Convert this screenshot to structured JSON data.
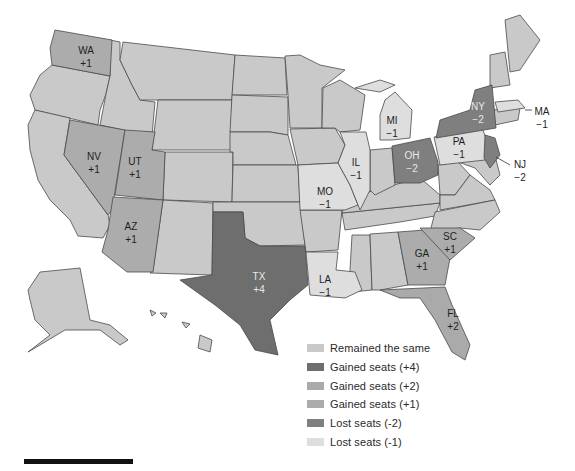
{
  "map": {
    "title": "",
    "colors": {
      "same": "#c9c9c9",
      "gain4": "#6e6e6e",
      "gain2": "#aaaaaa",
      "gain1": "#acacac",
      "lost2": "#7f7f7f",
      "lost1": "#dedede",
      "water": "#ffffff",
      "border": "#4a4a4a"
    },
    "states": [
      {
        "abbr": "WA",
        "change": "+1",
        "category": "gain1"
      },
      {
        "abbr": "NV",
        "change": "+1",
        "category": "gain1"
      },
      {
        "abbr": "UT",
        "change": "+1",
        "category": "gain1"
      },
      {
        "abbr": "AZ",
        "change": "+1",
        "category": "gain1"
      },
      {
        "abbr": "TX",
        "change": "+4",
        "category": "gain4"
      },
      {
        "abbr": "LA",
        "change": "−1",
        "category": "lost1"
      },
      {
        "abbr": "MO",
        "change": "−1",
        "category": "lost1"
      },
      {
        "abbr": "IL",
        "change": "−1",
        "category": "lost1"
      },
      {
        "abbr": "MI",
        "change": "−1",
        "category": "lost1"
      },
      {
        "abbr": "OH",
        "change": "−2",
        "category": "lost2"
      },
      {
        "abbr": "PA",
        "change": "−1",
        "category": "lost1"
      },
      {
        "abbr": "NY",
        "change": "−2",
        "category": "lost2"
      },
      {
        "abbr": "NJ",
        "change": "−2",
        "category": "lost2"
      },
      {
        "abbr": "MA",
        "change": "−1",
        "category": "lost1"
      },
      {
        "abbr": "GA",
        "change": "+1",
        "category": "gain1"
      },
      {
        "abbr": "SC",
        "change": "+1",
        "category": "gain1"
      },
      {
        "abbr": "FL",
        "change": "+2",
        "category": "gain2"
      }
    ],
    "labels": {
      "WA": {
        "abbr": "WA",
        "change": "+1"
      },
      "NV": {
        "abbr": "NV",
        "change": "+1"
      },
      "UT": {
        "abbr": "UT",
        "change": "+1"
      },
      "AZ": {
        "abbr": "AZ",
        "change": "+1"
      },
      "TX": {
        "abbr": "TX",
        "change": "+4"
      },
      "LA": {
        "abbr": "LA",
        "change": "−1"
      },
      "MO": {
        "abbr": "MO",
        "change": "−1"
      },
      "IL": {
        "abbr": "IL",
        "change": "−1"
      },
      "MI": {
        "abbr": "MI",
        "change": "−1"
      },
      "OH": {
        "abbr": "OH",
        "change": "−2"
      },
      "PA": {
        "abbr": "PA",
        "change": "−1"
      },
      "NY": {
        "abbr": "NY",
        "change": "−2"
      },
      "NJ": {
        "abbr": "NJ",
        "change": "−2"
      },
      "MA": {
        "abbr": "MA",
        "change": "−1"
      },
      "GA": {
        "abbr": "GA",
        "change": "+1"
      },
      "SC": {
        "abbr": "SC",
        "change": "+1"
      },
      "FL": {
        "abbr": "FL",
        "change": "+2"
      }
    }
  },
  "legend": {
    "items": [
      {
        "label": "Remained the same",
        "color": "#c9c9c9"
      },
      {
        "label": "Gained seats (+4)",
        "color": "#6e6e6e"
      },
      {
        "label": "Gained seats (+2)",
        "color": "#aaaaaa"
      },
      {
        "label": "Gained seats (+1)",
        "color": "#acacac"
      },
      {
        "label": "Lost seats (-2)",
        "color": "#7f7f7f"
      },
      {
        "label": "Lost seats (-1)",
        "color": "#dedede"
      }
    ]
  }
}
